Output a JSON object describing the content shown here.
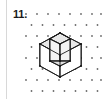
{
  "figure": {
    "problem_label": "11.",
    "kind": "isometric-cube-with-notch",
    "background_color": "#ffffff",
    "rule_color": "#d8d8d8",
    "label_color": "#1a1a1a"
  },
  "dot_grid": {
    "name": "triangular-isometric-dot-grid",
    "dot_color": "#6b6b6b",
    "dot_radius": 0.9,
    "columns_x": [
      26,
      37,
      48,
      59,
      70,
      81,
      92,
      101
    ],
    "rows_y": [
      14,
      25,
      36,
      47,
      58,
      69,
      80,
      91
    ],
    "row_offset_x": 5.5,
    "note": "Dots sit on an isometric lattice; alternate rows are shifted half a column."
  },
  "cube": {
    "line_color": "#1a1a1a",
    "line_width": 0.9,
    "top_face_fill": "#e8e8e8",
    "left_face_fill": "#ffffff",
    "right_face_fill": "#ffffff",
    "notch_floor_fill": "#e0e0e0",
    "notch_wall_fill": "#f4f4f4",
    "vertices": {
      "top": [
        60,
        33
      ],
      "upper_left": [
        40,
        44
      ],
      "upper_right": [
        81,
        44
      ],
      "center_front_top": [
        60,
        55
      ],
      "lower_left": [
        40,
        66
      ],
      "lower_right": [
        81,
        66
      ],
      "bottom": [
        60,
        77
      ]
    },
    "notch": {
      "outer_corner": [
        60,
        55
      ],
      "top_left_inner": [
        50,
        39
      ],
      "top_right_inner": [
        70,
        39
      ],
      "apex_inner": [
        60,
        44
      ],
      "floor_center": [
        60,
        61
      ],
      "depth_px": 11,
      "description": "A unit cube removed from the near-top corner, exposing two inner walls and a rhombic floor."
    }
  }
}
